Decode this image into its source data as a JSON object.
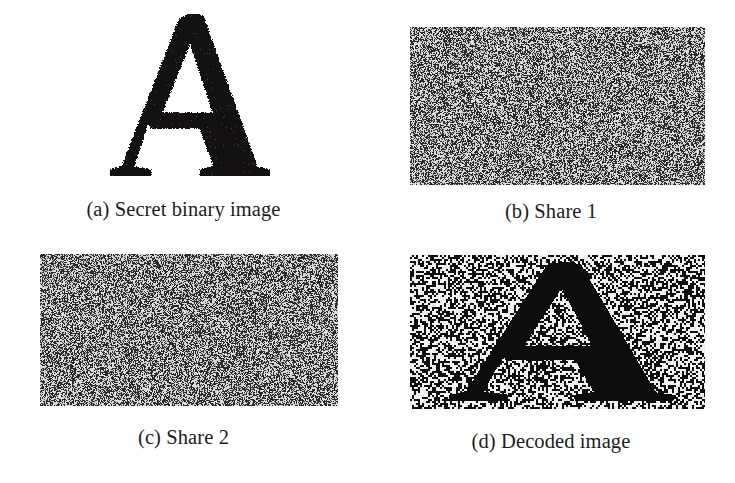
{
  "figure": {
    "layout": "2x2-grid",
    "background_color": "#ffffff",
    "caption_color": "#1c1c1c"
  },
  "panels": [
    {
      "id": "a",
      "caption": "(a) Secret binary image",
      "content_type": "binary-letter",
      "letter": "A",
      "letter_color": "#141210",
      "background_color": "#ffffff",
      "noise": false
    },
    {
      "id": "b",
      "caption": "(b) Share 1",
      "content_type": "random-noise",
      "noise": true,
      "noise_density": 0.5,
      "noise_dark_color": "#2b2b2b",
      "noise_light_color": "#d8d8d8",
      "mean_gray": "#8a8a8a"
    },
    {
      "id": "c",
      "caption": "(c) Share 2",
      "content_type": "random-noise",
      "noise": true,
      "noise_density": 0.5,
      "noise_dark_color": "#2b2b2b",
      "noise_light_color": "#d8d8d8",
      "mean_gray": "#8a8a8a"
    },
    {
      "id": "d",
      "caption": "(d) Decoded image",
      "content_type": "decoded-noise-letter",
      "letter": "A",
      "noise": true,
      "noise_density": 0.5,
      "noise_dark_color": "#111111",
      "noise_light_color": "#f2f2f2",
      "letter_color": "#0d0d0d"
    }
  ]
}
